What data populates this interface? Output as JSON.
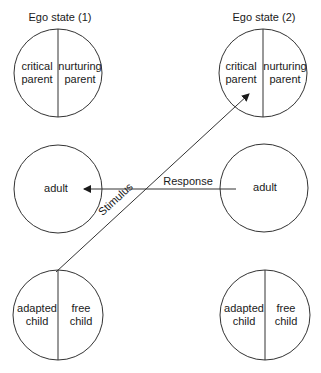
{
  "diagram": {
    "type": "transactional-analysis-crossed-transaction",
    "colors": {
      "stroke": "#333333",
      "text": "#1a1a1a",
      "background": "#ffffff"
    },
    "columns": [
      {
        "title": "Ego state (1)",
        "states": [
          {
            "kind": "parent",
            "left": [
              "critical",
              "parent"
            ],
            "right": [
              "nurturing",
              "parent"
            ]
          },
          {
            "kind": "adult",
            "label": "adult"
          },
          {
            "kind": "child",
            "left": [
              "adapted",
              "child"
            ],
            "right": [
              "free",
              "child"
            ]
          }
        ]
      },
      {
        "title": "Ego state (2)",
        "states": [
          {
            "kind": "parent",
            "left": [
              "critical",
              "parent"
            ],
            "right": [
              "nurturing",
              "parent"
            ]
          },
          {
            "kind": "adult",
            "label": "adult"
          },
          {
            "kind": "child",
            "left": [
              "adapted",
              "child"
            ],
            "right": [
              "free",
              "child"
            ]
          }
        ]
      }
    ],
    "arrows": [
      {
        "label": "Stimulus",
        "from": "Ego state (1) child",
        "to": "Ego state (2) parent"
      },
      {
        "label": "Response",
        "from": "Ego state (2) adult",
        "to": "Ego state (1) adult"
      }
    ]
  }
}
